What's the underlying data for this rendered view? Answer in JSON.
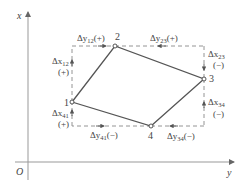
{
  "diagram": {
    "axes": {
      "vertical_label": "x",
      "horizontal_label": "y",
      "origin_label": "O"
    },
    "points": [
      {
        "id": "1",
        "label": "1",
        "cx": 72,
        "cy": 102
      },
      {
        "id": "2",
        "label": "2",
        "cx": 115,
        "cy": 46
      },
      {
        "id": "3",
        "label": "3",
        "cx": 204,
        "cy": 79
      },
      {
        "id": "4",
        "label": "4",
        "cx": 151,
        "cy": 126
      }
    ],
    "increments": {
      "dy12": {
        "base": "Δy",
        "sub": "12",
        "sign": "(+)"
      },
      "dy23": {
        "base": "Δy",
        "sub": "23",
        "sign": "(+)"
      },
      "dx23": {
        "base": "Δx",
        "sub": "23",
        "sign": "(−)"
      },
      "dx34": {
        "base": "Δx",
        "sub": "34",
        "sign": "(−)"
      },
      "dy34": {
        "base": "Δy",
        "sub": "34",
        "sign": "(−)"
      },
      "dy41": {
        "base": "Δy",
        "sub": "41",
        "sign": "(−)"
      },
      "dx41": {
        "base": "Δx",
        "sub": "41",
        "sign": "(+)"
      },
      "dx12": {
        "base": "Δx",
        "sub": "12",
        "sign": "(+)"
      }
    },
    "colors": {
      "line": "#555555",
      "axis": "#888888",
      "dashed": "#888888",
      "text": "#444444"
    }
  }
}
